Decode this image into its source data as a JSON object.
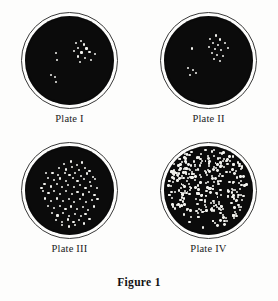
{
  "figure": {
    "caption": "Figure 1",
    "background_color": "#fdfdfc",
    "agar_color": "#0b0b0b",
    "colony_color": "#f2f2ee",
    "rim_color": "#3a3a3a"
  },
  "plates": [
    {
      "label": "Plate I",
      "colony_count": 18,
      "density": "sparse",
      "description": "Few colonies, loose cluster right of center with a small group at lower left",
      "colonies": [
        [
          57.0,
          30.0
        ],
        [
          62.5,
          28.5
        ],
        [
          66.0,
          32.0
        ],
        [
          60.0,
          35.5
        ],
        [
          69.0,
          36.5
        ],
        [
          55.5,
          39.5
        ],
        [
          63.5,
          41.0
        ],
        [
          72.5,
          40.0
        ],
        [
          78.5,
          42.5
        ],
        [
          59.5,
          45.5
        ],
        [
          67.5,
          47.0
        ],
        [
          74.0,
          49.5
        ],
        [
          62.0,
          52.0
        ],
        [
          34.5,
          42.0
        ],
        [
          36.0,
          49.5
        ],
        [
          29.0,
          66.0
        ],
        [
          33.5,
          68.5
        ],
        [
          35.0,
          74.5
        ]
      ]
    },
    {
      "label": "Plate II",
      "colony_count": 20,
      "density": "sparse",
      "description": "Few colonies, central cluster plus a small group at lower left",
      "colonies": [
        [
          52.0,
          25.5
        ],
        [
          58.5,
          22.0
        ],
        [
          63.0,
          26.5
        ],
        [
          55.5,
          30.0
        ],
        [
          61.0,
          32.5
        ],
        [
          68.5,
          30.0
        ],
        [
          50.5,
          34.5
        ],
        [
          57.0,
          37.0
        ],
        [
          64.5,
          38.5
        ],
        [
          72.0,
          36.0
        ],
        [
          53.5,
          41.5
        ],
        [
          60.0,
          43.5
        ],
        [
          66.0,
          45.0
        ],
        [
          56.0,
          48.5
        ],
        [
          63.0,
          50.5
        ],
        [
          31.5,
          36.5
        ],
        [
          27.0,
          58.5
        ],
        [
          32.5,
          60.5
        ],
        [
          29.5,
          66.0
        ],
        [
          36.0,
          64.0
        ]
      ]
    },
    {
      "label": "Plate III",
      "colony_count": 85,
      "density": "moderate",
      "description": "Moderate, countable colonies spread fairly evenly across the plate",
      "colonies": [
        [
          44.0,
          20.0
        ],
        [
          51.5,
          17.5
        ],
        [
          58.0,
          21.0
        ],
        [
          64.0,
          18.5
        ],
        [
          38.5,
          25.0
        ],
        [
          46.0,
          26.5
        ],
        [
          53.0,
          24.0
        ],
        [
          60.5,
          27.0
        ],
        [
          67.0,
          24.5
        ],
        [
          72.5,
          28.0
        ],
        [
          31.0,
          30.0
        ],
        [
          37.5,
          32.5
        ],
        [
          44.5,
          30.5
        ],
        [
          50.0,
          33.0
        ],
        [
          56.5,
          30.0
        ],
        [
          63.0,
          33.5
        ],
        [
          69.5,
          31.0
        ],
        [
          76.0,
          34.5
        ],
        [
          25.5,
          36.0
        ],
        [
          32.5,
          38.5
        ],
        [
          39.0,
          36.5
        ],
        [
          46.5,
          39.0
        ],
        [
          53.5,
          36.0
        ],
        [
          59.0,
          39.5
        ],
        [
          66.5,
          37.0
        ],
        [
          73.0,
          40.0
        ],
        [
          79.0,
          37.5
        ],
        [
          22.0,
          43.0
        ],
        [
          29.0,
          45.5
        ],
        [
          35.5,
          43.0
        ],
        [
          42.0,
          46.0
        ],
        [
          48.5,
          43.5
        ],
        [
          55.0,
          46.5
        ],
        [
          61.5,
          44.0
        ],
        [
          68.0,
          47.0
        ],
        [
          74.5,
          44.5
        ],
        [
          80.5,
          47.0
        ],
        [
          20.0,
          51.0
        ],
        [
          26.5,
          53.0
        ],
        [
          33.0,
          50.5
        ],
        [
          39.5,
          53.5
        ],
        [
          46.0,
          51.0
        ],
        [
          52.5,
          54.0
        ],
        [
          59.0,
          51.5
        ],
        [
          65.5,
          54.5
        ],
        [
          72.0,
          52.0
        ],
        [
          78.0,
          55.0
        ],
        [
          22.5,
          59.0
        ],
        [
          29.0,
          61.5
        ],
        [
          35.5,
          59.0
        ],
        [
          42.5,
          62.0
        ],
        [
          49.0,
          59.5
        ],
        [
          55.5,
          62.5
        ],
        [
          62.0,
          60.0
        ],
        [
          68.5,
          63.0
        ],
        [
          75.0,
          60.5
        ],
        [
          26.0,
          67.5
        ],
        [
          32.5,
          70.0
        ],
        [
          39.0,
          67.5
        ],
        [
          45.5,
          70.5
        ],
        [
          52.0,
          68.0
        ],
        [
          58.5,
          71.0
        ],
        [
          65.0,
          68.5
        ],
        [
          71.0,
          71.5
        ],
        [
          30.0,
          75.5
        ],
        [
          36.5,
          78.0
        ],
        [
          43.0,
          75.5
        ],
        [
          49.5,
          78.5
        ],
        [
          56.0,
          76.0
        ],
        [
          62.5,
          78.5
        ],
        [
          68.0,
          76.0
        ],
        [
          35.0,
          83.0
        ],
        [
          41.5,
          85.0
        ],
        [
          48.0,
          82.5
        ],
        [
          54.5,
          85.5
        ],
        [
          61.0,
          83.0
        ],
        [
          42.0,
          89.0
        ],
        [
          49.0,
          90.5
        ],
        [
          56.0,
          88.5
        ],
        [
          66.5,
          87.0
        ],
        [
          72.5,
          82.0
        ],
        [
          77.5,
          68.0
        ],
        [
          81.5,
          60.0
        ],
        [
          18.5,
          47.0
        ],
        [
          24.0,
          30.0
        ]
      ]
    },
    {
      "label": "Plate IV",
      "colony_count": 310,
      "density": "dense",
      "description": "Too numerous to count; colonies crowded across the entire plate, densest upper center",
      "colonies": null
    }
  ]
}
